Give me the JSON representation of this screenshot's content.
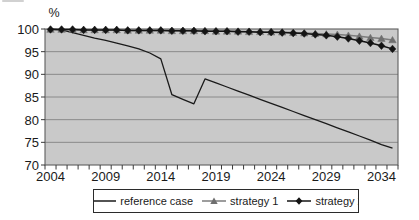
{
  "chart_data": {
    "type": "line",
    "title": "",
    "ylabel": "%",
    "ylim": [
      70,
      100
    ],
    "yticks": [
      100,
      95,
      90,
      85,
      80,
      75,
      70
    ],
    "x": [
      2004,
      2005,
      2006,
      2007,
      2008,
      2009,
      2010,
      2011,
      2012,
      2013,
      2014,
      2015,
      2016,
      2017,
      2018,
      2019,
      2020,
      2021,
      2022,
      2023,
      2024,
      2025,
      2026,
      2027,
      2028,
      2029,
      2030,
      2031,
      2032,
      2033,
      2034,
      2035
    ],
    "x_tick_labels": [
      "2004",
      "2009",
      "2014",
      "2019",
      "2024",
      "2029",
      "2034"
    ],
    "grid": true,
    "legend_position": "bottom",
    "plot_bg_color": "#c9c9c9",
    "grid_color": "#8a8a8a",
    "axis_color": "#5e5e5e",
    "tick_color": "#3a3a3a",
    "text_color": "#1a1a1a",
    "series": [
      {
        "name": "reference case",
        "color": "#1a1a1a",
        "marker": "none",
        "values": [
          100,
          99.8,
          99.2,
          98.6,
          98.0,
          97.5,
          96.9,
          96.3,
          95.6,
          94.7,
          93.4,
          85.5,
          84.5,
          83.5,
          89.0,
          88.1,
          87.2,
          86.3,
          85.4,
          84.5,
          83.6,
          82.7,
          81.8,
          80.9,
          80.0,
          79.1,
          78.2,
          77.3,
          76.4,
          75.5,
          74.5,
          73.7
        ]
      },
      {
        "name": "strategy 1",
        "color": "#7d7d7d",
        "marker": "triangle",
        "marker_color": "#6f6f6f",
        "values": [
          99.9,
          99.9,
          99.9,
          99.8,
          99.8,
          99.8,
          99.8,
          99.7,
          99.7,
          99.7,
          99.7,
          99.6,
          99.6,
          99.6,
          99.6,
          99.5,
          99.5,
          99.5,
          99.4,
          99.4,
          99.3,
          99.3,
          99.2,
          99.1,
          99.0,
          98.9,
          98.8,
          98.6,
          98.4,
          98.1,
          97.9,
          97.6
        ]
      },
      {
        "name": "strategy 2",
        "color": "#141414",
        "marker": "diamond",
        "marker_color": "#141414",
        "values": [
          99.9,
          99.9,
          99.9,
          99.8,
          99.8,
          99.8,
          99.8,
          99.7,
          99.7,
          99.7,
          99.7,
          99.6,
          99.6,
          99.6,
          99.5,
          99.5,
          99.5,
          99.4,
          99.4,
          99.3,
          99.3,
          99.2,
          99.1,
          99.0,
          98.8,
          98.6,
          98.3,
          97.9,
          97.4,
          96.9,
          96.3,
          95.6
        ]
      }
    ]
  }
}
